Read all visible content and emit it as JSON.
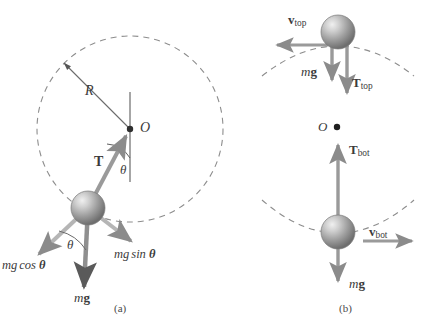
{
  "figure": {
    "background_color": "#ffffff",
    "ink_color": "#6f6f6f",
    "dark_ink_color": "#3b3b3b",
    "sphere_color": "#8f8f8f",
    "dashed_color": "#8a8a8a"
  },
  "panel_a": {
    "caption": "(a)",
    "center_label": "O",
    "radius_label": "R",
    "tension_label": "T",
    "angle_label_at_center": "θ",
    "angle_label_at_ball": "θ",
    "weight_label_m": "m",
    "weight_label_g": "g",
    "component_tangential": "mg sin θ",
    "component_radial": "mg cos θ",
    "component_tangential_parts": {
      "prefix": "mg",
      "trig": "sin",
      "angle": "θ"
    },
    "component_radial_parts": {
      "prefix": "mg",
      "trig": "cos",
      "angle": "θ"
    }
  },
  "panel_b": {
    "caption": "(b)",
    "center_label": "O",
    "top": {
      "velocity_label_main": "v",
      "velocity_label_sub": "top",
      "weight_label_m": "m",
      "weight_label_g": "g",
      "tension_label_main": "T",
      "tension_label_sub": "top"
    },
    "bottom": {
      "velocity_label_main": "v",
      "velocity_label_sub": "bot",
      "weight_label_m": "m",
      "weight_label_g": "g",
      "tension_label_main": "T",
      "tension_label_sub": "bot"
    }
  }
}
